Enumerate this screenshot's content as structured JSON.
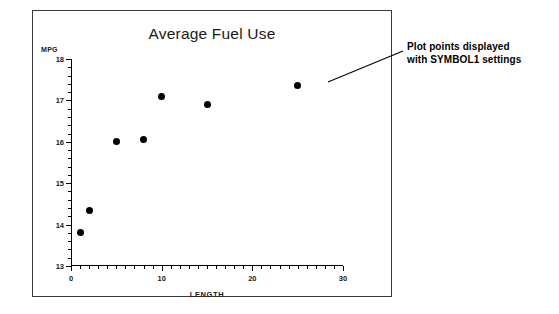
{
  "figure": {
    "title": "Average Fuel Use",
    "frame_color": "#3a3a3a",
    "background": "#ffffff"
  },
  "annotation": {
    "line1": "Plot points displayed",
    "line2": "with SYMBOL1 settings"
  },
  "chart_data": {
    "type": "scatter",
    "title": "Average Fuel Use",
    "xlabel": "LENGTH",
    "ylabel": "MPG",
    "xlim": [
      0,
      30
    ],
    "ylim": [
      13,
      18
    ],
    "xticks": [
      0,
      10,
      20,
      30
    ],
    "xtick_labels": [
      "0",
      "10",
      "20",
      "30"
    ],
    "yticks": [
      13,
      14,
      15,
      16,
      17,
      18
    ],
    "ytick_labels": [
      "13",
      "14",
      "15",
      "16",
      "17",
      "18"
    ],
    "x_minor_step": 1,
    "y_minor_step": 0.2,
    "grid": false,
    "legend": null,
    "marker": "filled-circle",
    "marker_color": "#000000",
    "points": [
      {
        "x": 1,
        "y": 13.8
      },
      {
        "x": 2,
        "y": 14.35
      },
      {
        "x": 5,
        "y": 16.0
      },
      {
        "x": 8,
        "y": 16.05
      },
      {
        "x": 10,
        "y": 17.1
      },
      {
        "x": 15,
        "y": 16.9
      },
      {
        "x": 25,
        "y": 17.35
      }
    ]
  }
}
